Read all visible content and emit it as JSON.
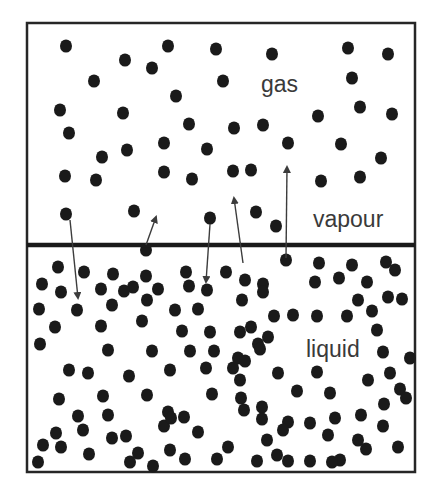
{
  "figure": {
    "width": 441,
    "height": 488,
    "container": {
      "x": 27,
      "y": 23,
      "width": 388,
      "height": 449,
      "stroke": "#262626",
      "stroke_width": 2.5
    },
    "interface": {
      "y": 245,
      "x1": 27,
      "x2": 415,
      "stroke": "#1a1a1a",
      "stroke_width": 4.5
    },
    "particle_color": "#1a1a1a",
    "arrow_color": "#3c3c3c"
  },
  "labels": {
    "gas": {
      "text": "gas",
      "x": 261,
      "y": 92,
      "size": 23
    },
    "vapour": {
      "text": "vapour",
      "x": 313,
      "y": 227,
      "size": 23
    },
    "liquid": {
      "text": "liquid",
      "x": 306,
      "y": 357,
      "size": 23
    }
  },
  "gas_particles": [
    [
      66,
      46
    ],
    [
      125,
      60
    ],
    [
      152,
      68
    ],
    [
      168,
      46
    ],
    [
      216,
      49
    ],
    [
      272,
      54
    ],
    [
      348,
      48
    ],
    [
      388,
      54
    ],
    [
      94,
      81
    ],
    [
      223,
      81
    ],
    [
      352,
      78
    ],
    [
      176,
      96
    ],
    [
      60,
      110
    ],
    [
      123,
      113
    ],
    [
      189,
      124
    ],
    [
      234,
      128
    ],
    [
      263,
      125
    ],
    [
      318,
      116
    ],
    [
      360,
      107
    ],
    [
      392,
      114
    ],
    [
      69,
      133
    ],
    [
      102,
      157
    ],
    [
      127,
      150
    ],
    [
      164,
      143
    ],
    [
      207,
      149
    ],
    [
      233,
      171
    ],
    [
      288,
      143
    ],
    [
      341,
      144
    ],
    [
      381,
      158
    ],
    [
      65,
      176
    ],
    [
      96,
      180
    ],
    [
      164,
      172
    ],
    [
      192,
      179
    ],
    [
      251,
      170
    ],
    [
      321,
      181
    ],
    [
      360,
      177
    ],
    [
      66,
      214
    ],
    [
      134,
      211
    ],
    [
      210,
      218
    ],
    [
      256,
      212
    ],
    [
      276,
      226
    ]
  ],
  "liquid_particles": [
    [
      146,
      250
    ],
    [
      58,
      267
    ],
    [
      84,
      272
    ],
    [
      113,
      274
    ],
    [
      133,
      287
    ],
    [
      146,
      276
    ],
    [
      186,
      272
    ],
    [
      226,
      272
    ],
    [
      286,
      260
    ],
    [
      319,
      263
    ],
    [
      352,
      265
    ],
    [
      367,
      282
    ],
    [
      386,
      262
    ],
    [
      395,
      270
    ],
    [
      42,
      284
    ],
    [
      61,
      292
    ],
    [
      101,
      289
    ],
    [
      124,
      291
    ],
    [
      158,
      289
    ],
    [
      189,
      286
    ],
    [
      207,
      290
    ],
    [
      245,
      280
    ],
    [
      263,
      284
    ],
    [
      315,
      282
    ],
    [
      339,
      278
    ],
    [
      358,
      300
    ],
    [
      39,
      309
    ],
    [
      77,
      310
    ],
    [
      112,
      305
    ],
    [
      147,
      300
    ],
    [
      175,
      310
    ],
    [
      198,
      309
    ],
    [
      242,
      300
    ],
    [
      263,
      292
    ],
    [
      274,
      316
    ],
    [
      293,
      315
    ],
    [
      317,
      316
    ],
    [
      347,
      316
    ],
    [
      372,
      311
    ],
    [
      388,
      297
    ],
    [
      402,
      299
    ],
    [
      55,
      327
    ],
    [
      101,
      326
    ],
    [
      142,
      321
    ],
    [
      182,
      331
    ],
    [
      210,
      332
    ],
    [
      240,
      332
    ],
    [
      251,
      327
    ],
    [
      268,
      337
    ],
    [
      238,
      358
    ],
    [
      258,
      344
    ],
    [
      377,
      330
    ],
    [
      40,
      344
    ],
    [
      108,
      350
    ],
    [
      152,
      351
    ],
    [
      190,
      351
    ],
    [
      214,
      351
    ],
    [
      245,
      361
    ],
    [
      260,
      349
    ],
    [
      383,
      352
    ],
    [
      410,
      358
    ],
    [
      69,
      370
    ],
    [
      88,
      373
    ],
    [
      129,
      376
    ],
    [
      170,
      370
    ],
    [
      206,
      368
    ],
    [
      233,
      368
    ],
    [
      240,
      380
    ],
    [
      278,
      373
    ],
    [
      317,
      372
    ],
    [
      368,
      380
    ],
    [
      390,
      373
    ],
    [
      59,
      399
    ],
    [
      103,
      396
    ],
    [
      147,
      395
    ],
    [
      212,
      394
    ],
    [
      241,
      398
    ],
    [
      262,
      407
    ],
    [
      297,
      391
    ],
    [
      330,
      393
    ],
    [
      400,
      389
    ],
    [
      78,
      416
    ],
    [
      108,
      415
    ],
    [
      168,
      412
    ],
    [
      184,
      417
    ],
    [
      244,
      410
    ],
    [
      262,
      419
    ],
    [
      288,
      422
    ],
    [
      310,
      423
    ],
    [
      335,
      418
    ],
    [
      361,
      415
    ],
    [
      384,
      404
    ],
    [
      406,
      398
    ],
    [
      56,
      433
    ],
    [
      83,
      430
    ],
    [
      126,
      436
    ],
    [
      164,
      426
    ],
    [
      171,
      418
    ],
    [
      198,
      432
    ],
    [
      267,
      440
    ],
    [
      283,
      430
    ],
    [
      328,
      435
    ],
    [
      358,
      440
    ],
    [
      383,
      426
    ],
    [
      43,
      445
    ],
    [
      61,
      447
    ],
    [
      112,
      438
    ],
    [
      138,
      453
    ],
    [
      170,
      450
    ],
    [
      228,
      447
    ],
    [
      277,
      455
    ],
    [
      310,
      461
    ],
    [
      340,
      460
    ],
    [
      366,
      449
    ],
    [
      398,
      447
    ],
    [
      38,
      462
    ],
    [
      89,
      454
    ],
    [
      130,
      462
    ],
    [
      153,
      466
    ],
    [
      185,
      459
    ],
    [
      217,
      459
    ],
    [
      257,
      461
    ],
    [
      288,
      461
    ],
    [
      332,
      462
    ]
  ],
  "arrows": [
    {
      "name": "condensation-arrow-1",
      "x1": 70,
      "y1": 220,
      "x2": 78,
      "y2": 298,
      "direction": "down"
    },
    {
      "name": "evaporation-arrow-1",
      "x1": 146,
      "y1": 245,
      "x2": 156,
      "y2": 217,
      "direction": "up"
    },
    {
      "name": "condensation-arrow-2",
      "x1": 210,
      "y1": 224,
      "x2": 206,
      "y2": 282,
      "direction": "down"
    },
    {
      "name": "evaporation-arrow-2",
      "x1": 243,
      "y1": 263,
      "x2": 234,
      "y2": 198,
      "direction": "up"
    },
    {
      "name": "evaporation-arrow-3",
      "x1": 286,
      "y1": 258,
      "x2": 287,
      "y2": 167,
      "direction": "up"
    }
  ],
  "particle_radius": 6
}
